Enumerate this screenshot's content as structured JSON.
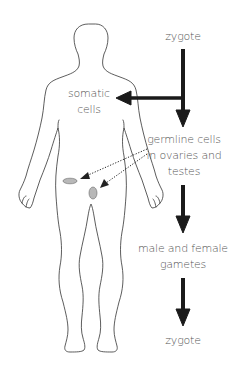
{
  "diagram": {
    "labels": {
      "zygote_top": "zygote",
      "somatic_line1": "somatic",
      "somatic_line2": "cells",
      "germline_line1": "germline cells",
      "germline_line2": "in ovaries and",
      "germline_line3": "testes",
      "gametes_line1": "male and female",
      "gametes_line2": "gametes",
      "zygote_bottom": "zygote"
    },
    "colors": {
      "arrow": "#1a1a1a",
      "outline": "#333333",
      "text": "#555555",
      "organ_fill": "#b8b8b8"
    },
    "nodes": [
      "zygote",
      "somatic cells",
      "germline cells in ovaries and testes",
      "male and female gametes",
      "zygote"
    ],
    "edges": [
      {
        "from": "zygote",
        "to": "somatic cells",
        "style": "solid"
      },
      {
        "from": "zygote",
        "to": "germline cells in ovaries and testes",
        "style": "solid"
      },
      {
        "from": "germline cells in ovaries and testes",
        "to": "ovary",
        "style": "dotted"
      },
      {
        "from": "germline cells in ovaries and testes",
        "to": "testis",
        "style": "dotted"
      },
      {
        "from": "germline cells in ovaries and testes",
        "to": "male and female gametes",
        "style": "solid"
      },
      {
        "from": "male and female gametes",
        "to": "zygote",
        "style": "solid"
      }
    ]
  }
}
